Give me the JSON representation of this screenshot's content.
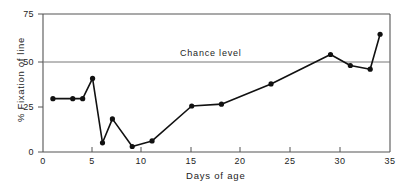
{
  "chart_data": {
    "type": "line",
    "title": "",
    "xlabel": "Days of age",
    "ylabel": "% Fixation of line",
    "xlim": [
      0,
      35
    ],
    "ylim": [
      0,
      75
    ],
    "xticks": [
      0,
      5,
      10,
      15,
      20,
      25,
      30,
      35
    ],
    "xtick_labels": [
      "0",
      "5",
      "10",
      "15",
      "20",
      "25",
      "30",
      "35"
    ],
    "yticks": [
      0,
      25,
      50,
      75
    ],
    "ytick_labels": [
      "0",
      "25",
      "50",
      "75"
    ],
    "grid": false,
    "legend": "none",
    "marker": "filled-circle",
    "line_color": "#111111",
    "annotations": [
      {
        "text": "Chance level",
        "type": "hline-label",
        "y": 50
      }
    ],
    "reference_lines": [
      {
        "name": "chance-level",
        "orientation": "horizontal",
        "y": 50,
        "label": "Chance level"
      }
    ],
    "x": [
      1,
      3,
      4,
      5,
      6,
      7,
      9,
      11,
      15,
      18,
      23,
      29,
      31,
      33,
      34
    ],
    "values": [
      29,
      29,
      29,
      40,
      5,
      18,
      3,
      6,
      25,
      26,
      37,
      53,
      47,
      45,
      64
    ],
    "series": [
      {
        "name": "% Fixation of line",
        "x": [
          1,
          3,
          4,
          5,
          6,
          7,
          9,
          11,
          15,
          18,
          23,
          29,
          31,
          33,
          34
        ],
        "values": [
          29,
          29,
          29,
          40,
          5,
          18,
          3,
          6,
          25,
          26,
          37,
          53,
          47,
          45,
          64
        ]
      }
    ]
  },
  "axes": {
    "y_label": "% Fixation of line",
    "x_label": "Days of age",
    "y_ticks": [
      "75",
      "50",
      "25",
      "0"
    ],
    "x_ticks": [
      "0",
      "5",
      "10",
      "15",
      "20",
      "25",
      "30",
      "35"
    ]
  },
  "chance": {
    "label": "Chance level"
  },
  "colors": {
    "line": "#111111",
    "axis": "#555555",
    "chance_line": "#777777",
    "background": "#ffffff"
  }
}
